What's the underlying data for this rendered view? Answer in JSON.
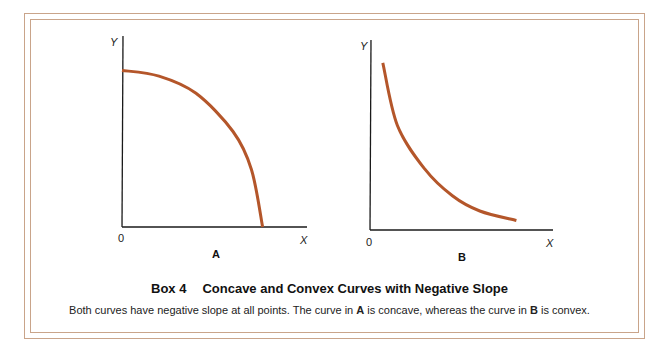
{
  "box": {
    "number_label": "Box 4",
    "title": "Concave and Convex Curves with Negative Slope",
    "caption_parts": [
      {
        "text": "Both curves have negative slope at all points. The curve in ",
        "bold": false
      },
      {
        "text": "A",
        "bold": true
      },
      {
        "text": " is concave, whereas the curve in ",
        "bold": false
      },
      {
        "text": "B",
        "bold": true
      },
      {
        "text": " is convex.",
        "bold": false
      }
    ],
    "frame_color": "#c9a48a"
  },
  "chart_data": [
    {
      "type": "line",
      "panel_label": "A",
      "description": "Concave curve with negative slope",
      "xlabel": "X",
      "ylabel": "Y",
      "origin_label": "0",
      "xlim": [
        0,
        1
      ],
      "ylim": [
        0,
        1
      ],
      "grid": false,
      "curve_color": "#b4562a",
      "curve_shape": "concave",
      "x": [
        0.0,
        0.2,
        0.4,
        0.6,
        0.7,
        0.76
      ],
      "y": [
        0.82,
        0.79,
        0.7,
        0.5,
        0.3,
        0.0
      ]
    },
    {
      "type": "line",
      "panel_label": "B",
      "description": "Convex curve with negative slope",
      "xlabel": "X",
      "ylabel": "Y",
      "origin_label": "0",
      "xlim": [
        0,
        1
      ],
      "ylim": [
        0,
        1
      ],
      "grid": false,
      "curve_color": "#b4562a",
      "curve_shape": "convex",
      "x": [
        0.07,
        0.15,
        0.3,
        0.45,
        0.6,
        0.8
      ],
      "y": [
        0.88,
        0.55,
        0.32,
        0.18,
        0.1,
        0.05
      ]
    }
  ]
}
